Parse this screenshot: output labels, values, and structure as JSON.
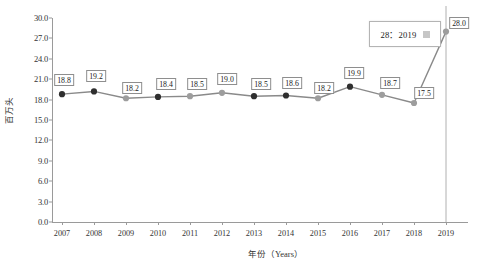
{
  "chart_data": {
    "type": "line",
    "title": "",
    "xlabel": "年份（Years）",
    "ylabel": "百万头",
    "categories": [
      "2007",
      "2008",
      "2009",
      "2010",
      "2011",
      "2012",
      "2013",
      "2014",
      "2015",
      "2016",
      "2017",
      "2018",
      "2019"
    ],
    "values": [
      18.8,
      19.2,
      18.2,
      18.4,
      18.5,
      19.0,
      18.5,
      18.6,
      18.2,
      19.9,
      18.7,
      17.5,
      28.0
    ],
    "point_labels": [
      "18.8",
      "19.2",
      "18.2",
      "18.4",
      "18.5",
      "19.0",
      "18.5",
      "18.6",
      "18.2",
      "19.9",
      "18.7",
      "17.5",
      "28.0"
    ],
    "marker_styles": [
      "dark",
      "dark",
      "light",
      "dark",
      "light",
      "light",
      "dark",
      "dark",
      "light",
      "dark",
      "light",
      "light",
      "light"
    ],
    "ylim": [
      0.0,
      30.0
    ],
    "ytick_labels": [
      "0.0",
      "3.0",
      "6.0",
      "9.0",
      "12.0",
      "15.0",
      "18.0",
      "21.0",
      "24.0",
      "27.0",
      "30.0"
    ],
    "ytick_values": [
      0.0,
      3.0,
      6.0,
      9.0,
      12.0,
      15.0,
      18.0,
      21.0,
      24.0,
      27.0,
      30.0
    ],
    "grid": false,
    "vertical_gridline_at": "2019",
    "legend_position": "none",
    "line_color": "#8a8a8a",
    "marker_dark_color": "#2f2f2f",
    "marker_light_color": "#9d9d9d",
    "axis_color": "#9a9a9a"
  },
  "tooltip": {
    "text": "28：2019",
    "swatch_color": "#c6c6c6"
  }
}
